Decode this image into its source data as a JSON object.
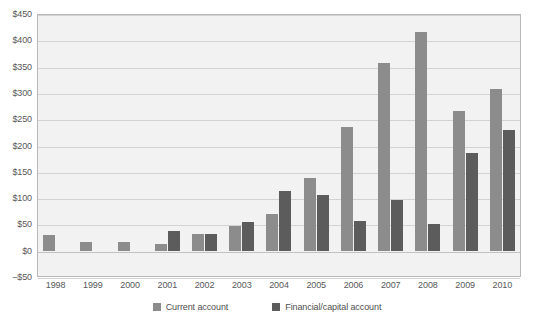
{
  "chart_data": {
    "type": "bar",
    "title": "",
    "subtitle": "",
    "xlabel": "",
    "ylabel": "",
    "categories": [
      "1998",
      "1999",
      "2000",
      "2001",
      "2002",
      "2003",
      "2004",
      "2005",
      "2006",
      "2007",
      "2008",
      "2009",
      "2010"
    ],
    "series": [
      {
        "name": "Current account",
        "color": "#8c8c8c",
        "values": [
          30,
          17,
          16,
          12,
          32,
          47,
          70,
          138,
          235,
          357,
          415,
          265,
          308
        ]
      },
      {
        "name": "Financial/capital account",
        "color": "#5c5c5c",
        "values": [
          0,
          0,
          0,
          37,
          31,
          55,
          113,
          105,
          57,
          97,
          50,
          185,
          230
        ]
      }
    ],
    "ylim": [
      -50,
      450
    ],
    "ytick_values": [
      -50,
      0,
      50,
      100,
      150,
      200,
      250,
      300,
      350,
      400,
      450
    ],
    "ytick_labels": [
      "–$50",
      "$0",
      "$50",
      "$100",
      "$150",
      "$200",
      "$250",
      "$300",
      "$350",
      "$400",
      "$450"
    ],
    "grid": true,
    "legend_position": "bottom",
    "plot_background": "#f2f2f2",
    "gridline_color": "#d2d2d2",
    "axis_text_color": "#58585a"
  }
}
